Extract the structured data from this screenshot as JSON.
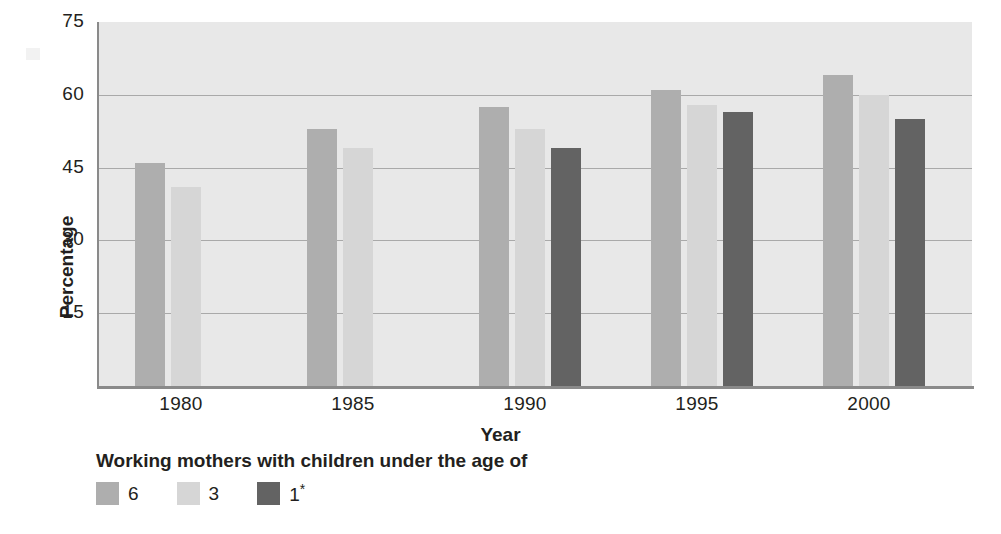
{
  "chart_data": {
    "type": "bar",
    "title": "",
    "subtitle": "",
    "xlabel": "Year",
    "ylabel": "Percentage",
    "categories": [
      "1980",
      "1985",
      "1990",
      "1995",
      "2000"
    ],
    "ylim": [
      0,
      75
    ],
    "yticks": [
      15,
      30,
      45,
      60,
      75
    ],
    "grid": true,
    "legend_position": "below-left",
    "legend_title": "Working mothers with children under the age of",
    "series": [
      {
        "name": "6",
        "color": "#aeaeae",
        "values": [
          46,
          53,
          57.5,
          61,
          64
        ]
      },
      {
        "name": "3",
        "color": "#d6d6d6",
        "values": [
          41,
          49,
          53,
          58,
          60
        ]
      },
      {
        "name": "1*",
        "color": "#636363",
        "values": [
          null,
          null,
          49,
          56.5,
          55
        ]
      }
    ]
  },
  "axis": {
    "y_ticks": [
      "75",
      "60",
      "45",
      "30",
      "15"
    ],
    "y_title": "Percentage",
    "x_ticks": [
      "1980",
      "1985",
      "1990",
      "1995",
      "2000"
    ],
    "x_title": "Year"
  },
  "legend": {
    "title": "Working mothers with children under the age of",
    "items": [
      {
        "label": "6",
        "color": "#aeaeae"
      },
      {
        "label": "3",
        "color": "#d6d6d6"
      },
      {
        "label": "1*",
        "color": "#636363"
      }
    ]
  },
  "style": {
    "plot_background": "#e8e8e8",
    "gridline_color": "#a9a9a9",
    "axis_color": "#8a8a8a",
    "text_color": "#231f20"
  }
}
